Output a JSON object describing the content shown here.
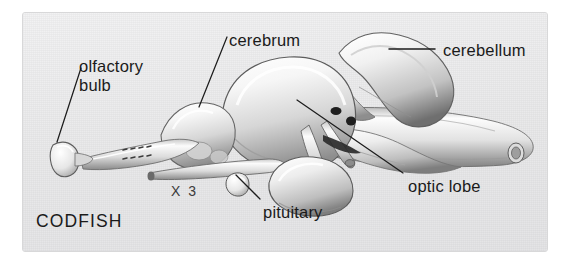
{
  "figure": {
    "subject": "CODFISH",
    "scale_note": "X 3",
    "background_color": "#ececed",
    "ink_color": "#1a1a1a",
    "labels": [
      {
        "id": "olfactory-bulb",
        "text_line1": "olfactory",
        "text_line2": "bulb",
        "x": 78,
        "y": 58
      },
      {
        "id": "cerebrum",
        "text": "cerebrum",
        "x": 228,
        "y": 31
      },
      {
        "id": "cerebellum",
        "text": "cerebellum",
        "x": 442,
        "y": 41
      },
      {
        "id": "optic-lobe",
        "text": "optic lobe",
        "x": 407,
        "y": 177
      },
      {
        "id": "pituitary",
        "text": "pituitary",
        "x": 262,
        "y": 203
      }
    ],
    "leaders": [
      {
        "id": "olfactory-bulb-leader",
        "x1": 80,
        "y1": 67,
        "x2": 56,
        "y2": 141
      },
      {
        "id": "cerebrum-leader",
        "x1": 226,
        "y1": 36,
        "x2": 197,
        "y2": 106
      },
      {
        "id": "cerebellum-leader",
        "x1": 434,
        "y1": 48,
        "x2": 389,
        "y2": 48
      },
      {
        "id": "optic-lobe-leader",
        "x1": 402,
        "y1": 172,
        "x2": 296,
        "y2": 99
      },
      {
        "id": "pituitary-leader",
        "x1": 259,
        "y1": 198,
        "x2": 235,
        "y2": 174
      }
    ],
    "structures": [
      "olfactory bulb",
      "olfactory tract",
      "cerebrum",
      "cerebellum",
      "optic lobe",
      "pituitary",
      "spinal cord",
      "cranial nerves"
    ]
  }
}
